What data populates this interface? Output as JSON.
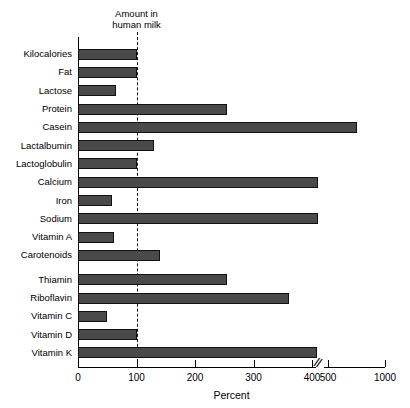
{
  "chart_data": {
    "type": "bar",
    "orientation": "horizontal",
    "title": "",
    "xlabel": "Percent",
    "ylabel": "",
    "xlim": [
      0,
      1000
    ],
    "grid": false,
    "legend": null,
    "annotation": {
      "text": "Amount in\nhuman milk",
      "reference_value": 100,
      "line_style": "dashed"
    },
    "axis_break": {
      "present": true,
      "after": 400,
      "before": 500,
      "symbol": "//"
    },
    "tick_labels": [
      "0",
      "100",
      "200",
      "300",
      "400",
      "500",
      "1000"
    ],
    "tick_values": [
      0,
      100,
      200,
      300,
      400,
      500,
      1000
    ],
    "categories": [
      "Kilocalories",
      "Fat",
      "Lactose",
      "Protein",
      "Casein",
      "Lactalbumin",
      "Lactoglobulin",
      "Calcium",
      "Iron",
      "Sodium",
      "Vitamin A",
      "Carotenoids",
      "Thiamin",
      "Riboflavin",
      "Vitamin C",
      "Vitamin D",
      "Vitamin K"
    ],
    "values": [
      100,
      100,
      65,
      255,
      750,
      130,
      100,
      410,
      58,
      408,
      62,
      140,
      255,
      360,
      50,
      100,
      405
    ],
    "bar_color": "#4a4a4a",
    "bar_edge_color": "#111111"
  }
}
